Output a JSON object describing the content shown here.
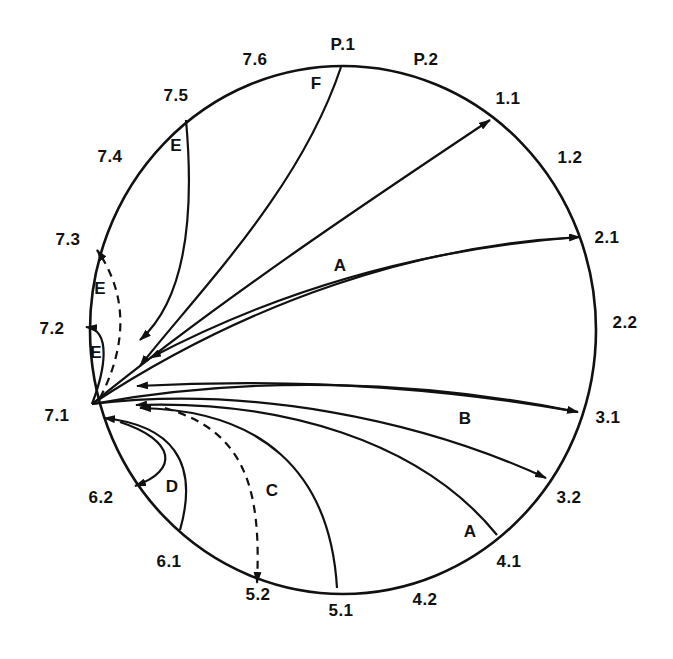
{
  "diagram": {
    "type": "circular transition diagram",
    "circle": {
      "cx": 343,
      "cy": 330,
      "rx": 253,
      "ry": 264,
      "stroke": "#111111"
    },
    "nodes": [
      {
        "id": "P.1",
        "label": "P.1",
        "x": 343,
        "y": 45
      },
      {
        "id": "P.2",
        "label": "P.2",
        "x": 426,
        "y": 60
      },
      {
        "id": "1.1",
        "label": "1.1",
        "x": 508,
        "y": 99
      },
      {
        "id": "1.2",
        "label": "1.2",
        "x": 570,
        "y": 158
      },
      {
        "id": "2.1",
        "label": "2.1",
        "x": 607,
        "y": 238
      },
      {
        "id": "2.2",
        "label": "2.2",
        "x": 625,
        "y": 323
      },
      {
        "id": "3.1",
        "label": "3.1",
        "x": 608,
        "y": 418
      },
      {
        "id": "3.2",
        "label": "3.2",
        "x": 569,
        "y": 498
      },
      {
        "id": "4.1",
        "label": "4.1",
        "x": 509,
        "y": 562
      },
      {
        "id": "4.2",
        "label": "4.2",
        "x": 425,
        "y": 600
      },
      {
        "id": "5.1",
        "label": "5.1",
        "x": 341,
        "y": 611
      },
      {
        "id": "5.2",
        "label": "5.2",
        "x": 258,
        "y": 595
      },
      {
        "id": "6.1",
        "label": "6.1",
        "x": 169,
        "y": 562
      },
      {
        "id": "6.2",
        "label": "6.2",
        "x": 101,
        "y": 498
      },
      {
        "id": "7.1",
        "label": "7.1",
        "x": 57,
        "y": 416
      },
      {
        "id": "7.2",
        "label": "7.2",
        "x": 52,
        "y": 329
      },
      {
        "id": "7.3",
        "label": "7.3",
        "x": 68,
        "y": 240
      },
      {
        "id": "7.4",
        "label": "7.4",
        "x": 110,
        "y": 157
      },
      {
        "id": "7.5",
        "label": "7.5",
        "x": 176,
        "y": 96
      },
      {
        "id": "7.6",
        "label": "7.6",
        "x": 255,
        "y": 60
      }
    ],
    "path_labels": [
      {
        "id": "F",
        "label": "F",
        "x": 316,
        "y": 84
      },
      {
        "id": "E-top",
        "label": "E",
        "x": 176,
        "y": 146
      },
      {
        "id": "A-upper",
        "label": "A",
        "x": 340,
        "y": 266
      },
      {
        "id": "E-mid",
        "label": "E",
        "x": 100,
        "y": 289
      },
      {
        "id": "E-low",
        "label": "E",
        "x": 96,
        "y": 353
      },
      {
        "id": "B",
        "label": "B",
        "x": 465,
        "y": 419
      },
      {
        "id": "D",
        "label": "D",
        "x": 172,
        "y": 487
      },
      {
        "id": "C",
        "label": "C",
        "x": 272,
        "y": 491
      },
      {
        "id": "A-lower",
        "label": "A",
        "x": 470,
        "y": 532
      }
    ],
    "edges": [
      {
        "from": "P.1",
        "to": "7.1",
        "group": "F",
        "style": "solid",
        "d": "M341,67 C300,190 200,290 140,366"
      },
      {
        "from": "7.5",
        "to": "7.1",
        "group": "E",
        "style": "solid",
        "d": "M186,120 C195,220 185,300 140,340"
      },
      {
        "from": "7.1",
        "to": "1.1",
        "group": "A",
        "style": "solid",
        "d": "M92,404 C220,300 370,200 490,120"
      },
      {
        "from": "7.1",
        "to": "2.1",
        "group": "A",
        "style": "solid",
        "d": "M92,404 C250,300 420,245 580,237"
      },
      {
        "from": "2.1",
        "to": "7.1",
        "group": "A",
        "style": "solid",
        "d": "M580,237 C400,250 260,300 150,358"
      },
      {
        "from": "7.1",
        "to": "7.3",
        "group": "E",
        "style": "dashed",
        "d": "M100,398 C130,340 125,290 97,250"
      },
      {
        "from": "7.1",
        "to": "7.2",
        "group": "E",
        "style": "solid",
        "d": "M92,404 C105,370 112,330 86,327"
      },
      {
        "from": "3.1",
        "to": "7.1",
        "group": "B",
        "style": "solid",
        "d": "M578,412 C400,380 250,380 137,386"
      },
      {
        "from": "7.1",
        "to": "3.1",
        "group": "B",
        "style": "solid",
        "d": "M92,404 C250,375 420,380 578,412"
      },
      {
        "from": "7.1",
        "to": "3.2",
        "group": "B",
        "style": "solid",
        "d": "M92,404 C250,385 420,420 546,478"
      },
      {
        "from": "4.1",
        "to": "7.1",
        "group": "A",
        "style": "solid",
        "d": "M497,535 C420,440 280,400 136,405"
      },
      {
        "from": "5.1",
        "to": "7.1",
        "group": "C",
        "style": "solid",
        "d": "M337,588 C330,470 260,410 140,408"
      },
      {
        "from": "7.1",
        "to": "5.2",
        "group": "C",
        "style": "dashed",
        "d": "M165,408 C240,430 262,480 257,583"
      },
      {
        "from": "6.1",
        "to": "7.1",
        "group": "D",
        "style": "solid",
        "d": "M180,530 C200,460 170,425 104,418"
      },
      {
        "from": "7.1",
        "to": "6.2",
        "group": "D",
        "style": "solid",
        "d": "M120,422 C175,440 180,470 135,486"
      }
    ]
  }
}
